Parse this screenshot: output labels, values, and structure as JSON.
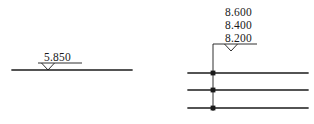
{
  "drawing": {
    "type": "elevation-level-annotation",
    "background_color": "#ffffff",
    "line_color": "#1a1a1a",
    "text_color": "#1a1a1a",
    "markers": [
      {
        "id": "left-level-marker",
        "label": "5.850",
        "symbol": "level-triangle",
        "datum_line": {
          "x1": 12,
          "x2": 132,
          "y": 70
        },
        "underline": {
          "x1": 38,
          "x2": 82,
          "y": 63
        },
        "triangle": {
          "cx": 48,
          "cy": 63,
          "width": 13,
          "height": 7
        },
        "text_position": {
          "x": 44,
          "y": 61
        }
      },
      {
        "id": "right-level-marker",
        "labels": [
          "8.600",
          "8.400",
          "8.200"
        ],
        "symbol": "level-triangle",
        "underline": {
          "x1": 213,
          "x2": 257,
          "y": 44
        },
        "triangle": {
          "cx": 231,
          "cy": 44,
          "width": 13,
          "height": 7
        },
        "leader": {
          "x": 213,
          "y1": 44,
          "y2": 111
        },
        "text_positions": [
          {
            "x": 225,
            "y": 16
          },
          {
            "x": 225,
            "y": 29
          },
          {
            "x": 225,
            "y": 42
          }
        ]
      }
    ],
    "slab_lines": [
      {
        "id": "slab-line-8600",
        "x1": 188,
        "x2": 308,
        "y": 73
      },
      {
        "id": "slab-line-8400",
        "x1": 188,
        "x2": 308,
        "y": 90
      },
      {
        "id": "slab-line-8200",
        "x1": 188,
        "x2": 308,
        "y": 108
      }
    ],
    "junction_dots": [
      {
        "id": "junction-dot-8600",
        "cx": 213,
        "cy": 73
      },
      {
        "id": "junction-dot-8400",
        "cx": 213,
        "cy": 90
      },
      {
        "id": "junction-dot-8200",
        "cx": 213,
        "cy": 108
      }
    ]
  }
}
